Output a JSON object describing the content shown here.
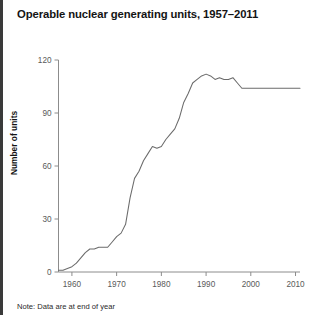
{
  "chart_data": {
    "type": "line",
    "title": "Operable nuclear generating units, 1957–2011",
    "xlabel": "",
    "ylabel": "Number of units",
    "note": "Note: Data are at end of year",
    "xlim": [
      1957,
      2011
    ],
    "ylim": [
      0,
      120
    ],
    "grid": false,
    "legend": "none",
    "xticks": [
      1960,
      1970,
      1980,
      1990,
      2000,
      2010
    ],
    "yticks": [
      0,
      30,
      60,
      90,
      120
    ],
    "line_color": "#6b6b6b",
    "axis_color": "#8c8c8c",
    "series": [
      {
        "name": "Operable nuclear generating units",
        "x": [
          1957,
          1958,
          1959,
          1960,
          1961,
          1962,
          1963,
          1964,
          1965,
          1966,
          1967,
          1968,
          1969,
          1970,
          1971,
          1972,
          1973,
          1974,
          1975,
          1976,
          1977,
          1978,
          1979,
          1980,
          1981,
          1982,
          1983,
          1984,
          1985,
          1986,
          1987,
          1988,
          1989,
          1990,
          1991,
          1992,
          1993,
          1994,
          1995,
          1996,
          1997,
          1998,
          1999,
          2000,
          2001,
          2002,
          2003,
          2004,
          2005,
          2006,
          2007,
          2008,
          2009,
          2010,
          2011
        ],
        "y": [
          1,
          1,
          2,
          3,
          5,
          8,
          11,
          13,
          13,
          14,
          14,
          14,
          17,
          20,
          22,
          27,
          42,
          53,
          57,
          63,
          67,
          71,
          70,
          71,
          75,
          78,
          81,
          87,
          96,
          101,
          107,
          109,
          111,
          112,
          111,
          109,
          110,
          109,
          109,
          110,
          107,
          104,
          104,
          104,
          104,
          104,
          104,
          104,
          104,
          104,
          104,
          104,
          104,
          104,
          104
        ]
      }
    ]
  }
}
